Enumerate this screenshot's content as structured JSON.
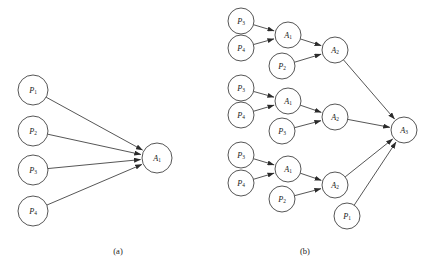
{
  "figure": {
    "background": "#ffffff",
    "stroke_color": "#2b2b2b",
    "text_color": "#1a1a1a"
  },
  "panels": [
    {
      "id": "panel-a",
      "caption": "(a)",
      "caption_x": 118,
      "caption_y": 254,
      "nodes": [
        {
          "id": "a-p1",
          "base": "P",
          "sub": "1",
          "x": 33,
          "y": 90,
          "r": 15
        },
        {
          "id": "a-p2",
          "base": "P",
          "sub": "2",
          "x": 33,
          "y": 131,
          "r": 15
        },
        {
          "id": "a-p3",
          "base": "P",
          "sub": "3",
          "x": 33,
          "y": 170,
          "r": 15
        },
        {
          "id": "a-p4",
          "base": "P",
          "sub": "4",
          "x": 33,
          "y": 211,
          "r": 15
        },
        {
          "id": "a-a1",
          "base": "A",
          "sub": "1",
          "x": 157,
          "y": 158,
          "r": 15
        }
      ],
      "edges": [
        {
          "from": "a-p1",
          "to": "a-a1"
        },
        {
          "from": "a-p2",
          "to": "a-a1"
        },
        {
          "from": "a-p3",
          "to": "a-a1"
        },
        {
          "from": "a-p4",
          "to": "a-a1"
        }
      ]
    },
    {
      "id": "panel-b",
      "caption": "(b)",
      "caption_x": 305,
      "caption_y": 254,
      "nodes": [
        {
          "id": "b-g1-p3",
          "base": "P",
          "sub": "3",
          "x": 241,
          "y": 21,
          "r": 13
        },
        {
          "id": "b-g1-p4",
          "base": "P",
          "sub": "4",
          "x": 241,
          "y": 48,
          "r": 13
        },
        {
          "id": "b-g1-a1",
          "base": "A",
          "sub": "1",
          "x": 288,
          "y": 35,
          "r": 13
        },
        {
          "id": "b-g1-p2",
          "base": "P",
          "sub": "2",
          "x": 282,
          "y": 66,
          "r": 13
        },
        {
          "id": "b-g1-a2",
          "base": "A",
          "sub": "2",
          "x": 335,
          "y": 50,
          "r": 13
        },
        {
          "id": "b-g2-p3",
          "base": "P",
          "sub": "3",
          "x": 241,
          "y": 88,
          "r": 13
        },
        {
          "id": "b-g2-p4",
          "base": "P",
          "sub": "4",
          "x": 241,
          "y": 115,
          "r": 13
        },
        {
          "id": "b-g2-a1",
          "base": "A",
          "sub": "1",
          "x": 288,
          "y": 101,
          "r": 13
        },
        {
          "id": "b-g2-p3b",
          "base": "P",
          "sub": "3",
          "x": 282,
          "y": 131,
          "r": 13
        },
        {
          "id": "b-g2-a2",
          "base": "A",
          "sub": "2",
          "x": 335,
          "y": 117,
          "r": 13
        },
        {
          "id": "b-g3-p3",
          "base": "P",
          "sub": "3",
          "x": 241,
          "y": 155,
          "r": 13
        },
        {
          "id": "b-g3-p4",
          "base": "P",
          "sub": "4",
          "x": 241,
          "y": 183,
          "r": 13
        },
        {
          "id": "b-g3-a1",
          "base": "A",
          "sub": "1",
          "x": 288,
          "y": 169,
          "r": 13
        },
        {
          "id": "b-g3-p2",
          "base": "P",
          "sub": "2",
          "x": 282,
          "y": 199,
          "r": 13
        },
        {
          "id": "b-g3-a2",
          "base": "A",
          "sub": "2",
          "x": 335,
          "y": 185,
          "r": 13
        },
        {
          "id": "b-p1",
          "base": "P",
          "sub": "1",
          "x": 347,
          "y": 216,
          "r": 13
        },
        {
          "id": "b-a3",
          "base": "A",
          "sub": "3",
          "x": 404,
          "y": 130,
          "r": 13
        }
      ],
      "edges": [
        {
          "from": "b-g1-p3",
          "to": "b-g1-a1"
        },
        {
          "from": "b-g1-p4",
          "to": "b-g1-a1"
        },
        {
          "from": "b-g1-a1",
          "to": "b-g1-a2"
        },
        {
          "from": "b-g1-p2",
          "to": "b-g1-a2"
        },
        {
          "from": "b-g1-a2",
          "to": "b-a3"
        },
        {
          "from": "b-g2-p3",
          "to": "b-g2-a1"
        },
        {
          "from": "b-g2-p4",
          "to": "b-g2-a1"
        },
        {
          "from": "b-g2-a1",
          "to": "b-g2-a2"
        },
        {
          "from": "b-g2-p3b",
          "to": "b-g2-a2"
        },
        {
          "from": "b-g2-a2",
          "to": "b-a3"
        },
        {
          "from": "b-g3-p3",
          "to": "b-g3-a1"
        },
        {
          "from": "b-g3-p4",
          "to": "b-g3-a1"
        },
        {
          "from": "b-g3-a1",
          "to": "b-g3-a2"
        },
        {
          "from": "b-g3-p2",
          "to": "b-g3-a2"
        },
        {
          "from": "b-g3-a2",
          "to": "b-a3"
        },
        {
          "from": "b-p1",
          "to": "b-a3"
        }
      ]
    }
  ]
}
